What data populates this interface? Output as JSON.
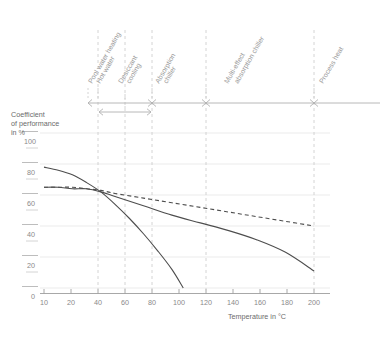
{
  "chart_data": {
    "type": "line",
    "title": "",
    "xlabel": "Temperature in °C",
    "ylabel": "Coefficient of performance in %",
    "xlim": [
      0,
      210
    ],
    "ylim": [
      0,
      110
    ],
    "xticks": [
      10,
      20,
      40,
      60,
      80,
      100,
      120,
      140,
      160,
      180,
      200
    ],
    "xtick_labels": [
      "10",
      "20",
      "40",
      "60",
      "80",
      "100",
      "120",
      "140",
      "160",
      "180",
      "200"
    ],
    "yticks": [
      0,
      20,
      40,
      60,
      80,
      100
    ],
    "ytick_labels": [
      "0",
      "20",
      "40",
      "60",
      "80",
      "100"
    ],
    "yminorticks": [
      10,
      30,
      50,
      70,
      90
    ],
    "grid": "horizontal",
    "legend": "none",
    "series": [
      {
        "name": "solid-rising-then-falling-steep",
        "style": "solid",
        "color": "#4d4d4d",
        "points": [
          [
            10,
            78
          ],
          [
            20,
            76
          ],
          [
            30,
            73
          ],
          [
            40,
            68
          ],
          [
            50,
            62
          ],
          [
            60,
            54
          ],
          [
            70,
            45
          ],
          [
            80,
            35
          ],
          [
            90,
            24
          ],
          [
            100,
            12
          ],
          [
            108,
            0
          ]
        ]
      },
      {
        "name": "solid-gentle-decline",
        "style": "solid",
        "color": "#4d4d4d",
        "points": [
          [
            10,
            65
          ],
          [
            20,
            65
          ],
          [
            30,
            64
          ],
          [
            40,
            64
          ],
          [
            50,
            62
          ],
          [
            60,
            59
          ],
          [
            80,
            53
          ],
          [
            100,
            47
          ],
          [
            120,
            42
          ],
          [
            140,
            37
          ],
          [
            160,
            31
          ],
          [
            180,
            23
          ],
          [
            200,
            11
          ]
        ]
      },
      {
        "name": "dashed-shallow-decline",
        "style": "dashed",
        "color": "#4d4d4d",
        "points": [
          [
            10,
            65
          ],
          [
            20,
            65
          ],
          [
            30,
            65
          ],
          [
            40,
            64
          ],
          [
            50,
            63
          ],
          [
            60,
            61
          ],
          [
            80,
            58
          ],
          [
            100,
            55
          ],
          [
            120,
            52
          ],
          [
            140,
            49
          ],
          [
            160,
            46
          ],
          [
            180,
            43
          ],
          [
            200,
            40
          ]
        ]
      }
    ],
    "category_markers": {
      "axis_y_percent_line": 100,
      "dividers": [
        40,
        60,
        80,
        120,
        200
      ],
      "bands": [
        {
          "label": "Pool water heating\nHot water",
          "start": 10,
          "end": 80
        },
        {
          "label": "Desiccant cooling",
          "start": 40,
          "end": 60
        },
        {
          "label": "Absorption chiller",
          "start": 80,
          "end": 120
        },
        {
          "label": "Multi-effect absorption chiller",
          "start": 120,
          "end": 200
        },
        {
          "label": "Process heat",
          "start": 200,
          "end": 210
        }
      ]
    }
  },
  "axis": {
    "ylabel_line1": "Coefficient",
    "ylabel_line2": "of performance",
    "ylabel_line3": "in %",
    "xlabel": "Temperature in °C"
  },
  "yticks": {
    "t100": "100",
    "t80": "80",
    "t60": "60",
    "t40": "40",
    "t20": "20",
    "t0": "0"
  },
  "xticks": {
    "t10": "10",
    "t20": "20",
    "t40": "40",
    "t60": "60",
    "t80": "80",
    "t100": "100",
    "t120": "120",
    "t140": "140",
    "t160": "160",
    "t180": "180",
    "t200": "200"
  },
  "categories": {
    "c1l1": "Pool water heating",
    "c1l2": "Hot water",
    "c2": "Desiccant",
    "c2b": "cooling",
    "c3l1": "Absorption",
    "c3l2": "chiller",
    "c4l1": "Multi-effect",
    "c4l2": "absorption chiller",
    "c5": "Process heat"
  },
  "colors": {
    "curve": "#4d4d4d",
    "grid": "#e2e2e2",
    "marker": "#bdbdbd",
    "text": "#6b6b6b"
  }
}
